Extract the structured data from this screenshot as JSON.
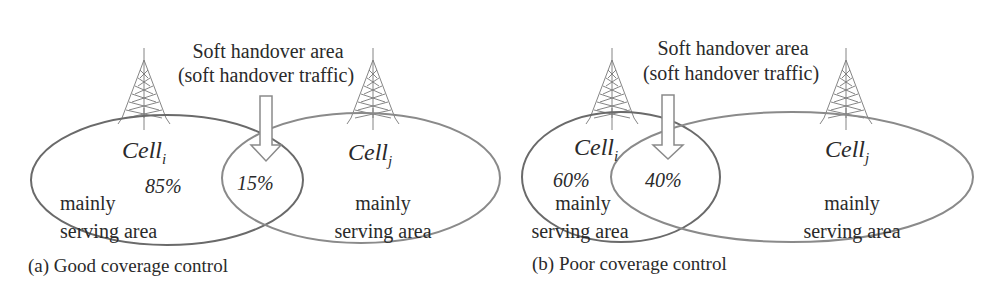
{
  "figure": {
    "panels": [
      {
        "id": "a",
        "caption": "(a) Good coverage control",
        "handover_label_line1": "Soft handover area",
        "handover_label_line2": "(soft handover traffic)",
        "cell_i": {
          "name": "Cell",
          "subscript": "i",
          "share": "85%",
          "area_line1": "mainly",
          "area_line2": "serving area"
        },
        "overlap_share": "15%",
        "cell_j": {
          "name": "Cell",
          "subscript": "j",
          "area_line1": "mainly",
          "area_line2": "serving area"
        }
      },
      {
        "id": "b",
        "caption": "(b) Poor coverage control",
        "handover_label_line1": "Soft handover area",
        "handover_label_line2": "(soft handover traffic)",
        "cell_i": {
          "name": "Cell",
          "subscript": "i",
          "share": "60%",
          "area_line1": "mainly",
          "area_line2": "serving area"
        },
        "overlap_share": "40%",
        "cell_j": {
          "name": "Cell",
          "subscript": "j",
          "area_line1": "mainly",
          "area_line2": "serving area"
        }
      }
    ],
    "icons": [
      "cell-tower-icon",
      "down-arrow-icon"
    ]
  }
}
